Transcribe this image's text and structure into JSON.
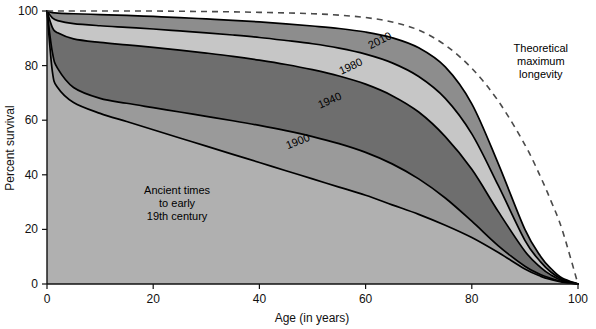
{
  "chart_data": {
    "type": "area",
    "title": "",
    "xlabel": "Age (in years)",
    "ylabel": "Percent survival",
    "xlim": [
      0,
      100
    ],
    "ylim": [
      0,
      100
    ],
    "xticks": [
      0,
      20,
      40,
      60,
      80,
      100
    ],
    "yticks": [
      0,
      20,
      40,
      60,
      80,
      100
    ],
    "grid": false,
    "legend_position": "inline-curve-labels",
    "x": [
      0,
      1,
      2,
      5,
      10,
      15,
      20,
      25,
      30,
      35,
      40,
      45,
      50,
      55,
      60,
      65,
      70,
      75,
      80,
      85,
      90,
      93,
      95,
      97,
      100
    ],
    "series": [
      {
        "name": "2010",
        "label": "2010",
        "fill_color": "#8d8d8d",
        "values": [
          100,
          99.4,
          99.2,
          99.0,
          98.7,
          98.4,
          98.0,
          97.6,
          97.1,
          96.6,
          96.0,
          95.3,
          94.5,
          93.6,
          92.3,
          90.2,
          86.5,
          79.5,
          66.0,
          44.0,
          20.0,
          10.0,
          5.5,
          2.2,
          0
        ]
      },
      {
        "name": "1980",
        "label": "1980",
        "fill_color": "#c6c6c6",
        "values": [
          100,
          97.5,
          96.5,
          95.4,
          94.6,
          94.0,
          93.4,
          92.7,
          92.0,
          91.2,
          90.3,
          89.2,
          88.0,
          86.4,
          84.2,
          81.0,
          76.0,
          68.0,
          55.0,
          36.0,
          16.0,
          8.0,
          4.2,
          1.7,
          0
        ]
      },
      {
        "name": "1940",
        "label": "1940",
        "fill_color": "#6e6e6e",
        "values": [
          100,
          94.0,
          92.0,
          89.8,
          88.5,
          87.6,
          86.7,
          85.7,
          84.6,
          83.4,
          82.0,
          80.4,
          78.5,
          76.2,
          73.2,
          69.0,
          63.0,
          54.0,
          42.0,
          26.5,
          12.0,
          6.0,
          3.2,
          1.3,
          0
        ]
      },
      {
        "name": "1900",
        "label": "1900",
        "fill_color": "#9a9a9a",
        "values": [
          100,
          85.0,
          79.0,
          72.0,
          68.0,
          66.2,
          64.6,
          63.0,
          61.4,
          59.8,
          58.1,
          56.2,
          54.0,
          51.4,
          48.2,
          44.0,
          38.5,
          31.5,
          23.0,
          14.0,
          6.5,
          3.4,
          2.0,
          0.9,
          0
        ]
      },
      {
        "name": "Ancient times to early 19th century",
        "label": "",
        "fill_color": "#b0b0b0",
        "values": [
          100,
          78.0,
          72.0,
          66.5,
          62.5,
          59.5,
          56.5,
          53.5,
          50.5,
          47.5,
          44.5,
          41.5,
          38.5,
          35.5,
          32.5,
          29.0,
          25.5,
          21.5,
          17.0,
          11.5,
          5.5,
          2.8,
          1.6,
          0.7,
          0
        ]
      }
    ],
    "theoretical": {
      "name": "Theoretical maximum longevity",
      "values": [
        100,
        100,
        100,
        100,
        100,
        100,
        100,
        99.9,
        99.8,
        99.7,
        99.5,
        99.3,
        99.0,
        98.5,
        97.6,
        96.0,
        93.0,
        87.5,
        79.0,
        67.0,
        51.0,
        39.0,
        30.0,
        20.0,
        0
      ],
      "style": "dashed",
      "color": "#4a4a4a"
    },
    "annotations": [
      {
        "id": "ancient-times",
        "lines": [
          "Ancient times",
          "to early",
          "19th century"
        ],
        "x": 24.5,
        "y": 33.0
      },
      {
        "id": "theoretical-maximum-longevity",
        "lines": [
          "Theoretical",
          "maximum",
          "longevity"
        ],
        "x": 93.0,
        "y": 85.0
      }
    ],
    "curve_label_positions": [
      {
        "name": "2010",
        "x": 63.0,
        "y": 88.0,
        "rotate": -27
      },
      {
        "name": "1980",
        "x": 57.5,
        "y": 78.5,
        "rotate": -25
      },
      {
        "name": "1940",
        "x": 53.5,
        "y": 66.0,
        "rotate": -24
      },
      {
        "name": "1900",
        "x": 47.5,
        "y": 51.0,
        "rotate": -22
      }
    ]
  },
  "axes": {
    "x_title": "Age (in years)",
    "y_title": "Percent survival",
    "x_tick_labels": [
      "0",
      "20",
      "40",
      "60",
      "80",
      "100"
    ],
    "y_tick_labels": [
      "0",
      "20",
      "40",
      "60",
      "80",
      "100"
    ]
  },
  "colors": {
    "background": "#ffffff",
    "axis": "#111111",
    "curve_stroke": "#000000",
    "theoretical": "#4a4a4a"
  }
}
